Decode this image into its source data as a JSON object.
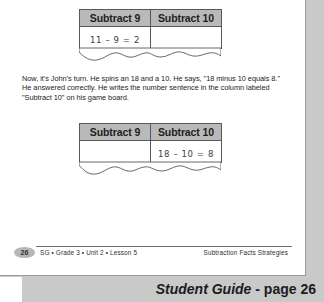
{
  "page": {
    "banner_title": "Student Guide",
    "banner_sep": " - ",
    "banner_page": "page 26"
  },
  "table_one": {
    "headers": [
      "Subtract 9",
      "Subtract 10"
    ],
    "cells": [
      "11 – 9 = 2",
      ""
    ]
  },
  "table_two": {
    "headers": [
      "Subtract 9",
      "Subtract 10"
    ],
    "cells": [
      "",
      "18 – 10 = 8"
    ]
  },
  "body": {
    "paragraph": "Now, it's John's turn. He spins an 18 and a 10. He says, \"18 minus 10 equals 8.\" He answered correctly. He writes the number sentence in the column labeled \"Subtract 10\" on his game board."
  },
  "footer": {
    "page_number": "26",
    "left_text": "SG • Grade 3 • Unit 2 • Lesson 5",
    "right_text": "Subtraction Facts Strategies"
  },
  "colors": {
    "header_fill": "#b9b9b9",
    "page_background": "#c9c9c9",
    "sheet": "#ffffff",
    "rule": "#6e7174"
  }
}
